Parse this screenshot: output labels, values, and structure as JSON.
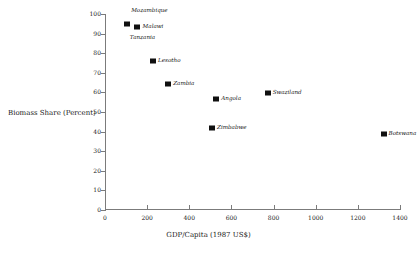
{
  "chart_data": {
    "type": "scatter",
    "title": "",
    "xlabel": "GDP/Capita  (1987 US$)",
    "ylabel": "Biomass Share (Percent)",
    "xlim": [
      0,
      1400
    ],
    "ylim": [
      0,
      100
    ],
    "xticks": [
      0,
      200,
      400,
      600,
      800,
      1000,
      1200,
      1400
    ],
    "yticks": [
      0,
      10,
      20,
      30,
      40,
      50,
      60,
      70,
      80,
      90,
      100
    ],
    "grid": false,
    "legend": "none",
    "points": [
      {
        "label": "Mozambique",
        "x": 105,
        "y": 95,
        "label_dx": 4,
        "label_dy": -13,
        "marker": true
      },
      {
        "label": "Malawi",
        "x": 150,
        "y": 93.5,
        "label_dx": 6,
        "label_dy": 0,
        "marker": true
      },
      {
        "label": "Tanzania",
        "x": 118,
        "y": 88,
        "label_dx": 0,
        "label_dy": 0,
        "marker": false
      },
      {
        "label": "Lesotho",
        "x": 228,
        "y": 76,
        "label_dx": 5,
        "label_dy": 0,
        "marker": true
      },
      {
        "label": "Zambia",
        "x": 300,
        "y": 64.5,
        "label_dx": 5,
        "label_dy": 0,
        "marker": true
      },
      {
        "label": "Angola",
        "x": 528,
        "y": 56.5,
        "label_dx": 5,
        "label_dy": 0,
        "marker": true
      },
      {
        "label": "Swaziland",
        "x": 772,
        "y": 59.5,
        "label_dx": 5,
        "label_dy": 0,
        "marker": true
      },
      {
        "label": "Zimbabwe",
        "x": 508,
        "y": 42,
        "label_dx": 5,
        "label_dy": 0,
        "marker": true
      },
      {
        "label": "Botswana",
        "x": 1322,
        "y": 39,
        "label_dx": 5,
        "label_dy": 0,
        "marker": true
      }
    ]
  },
  "axis_colors": {
    "line": "#7b7b7b",
    "marker": "#101010",
    "text": "#1a1a1a"
  }
}
